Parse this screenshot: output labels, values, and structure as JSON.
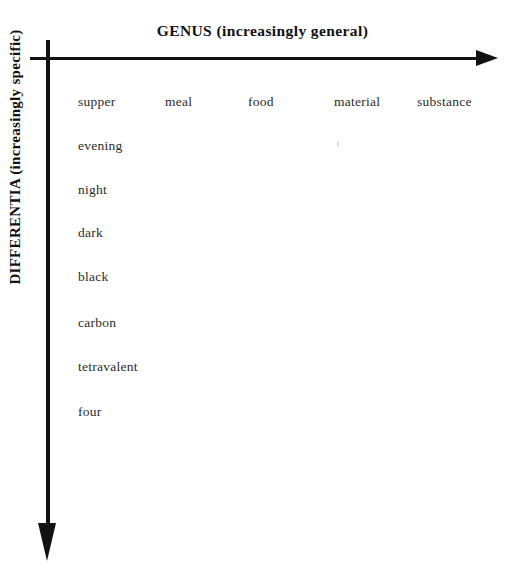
{
  "figure": {
    "background_color": "#ffffff",
    "ink_color": "#121212",
    "text_color": "#2b2b2b"
  },
  "axes": {
    "horizontal": {
      "title": "GENUS  (increasingly general)",
      "direction": "right",
      "arrow": "arrow-right"
    },
    "vertical": {
      "title": "DIFFERENTIA  (increasingly specific)",
      "direction": "down",
      "arrow": "arrow-down"
    }
  },
  "chart_data": {
    "type": "table",
    "title": "GENUS  (increasingly general)",
    "xlabel": "GENUS  (increasingly general)",
    "ylabel": "DIFFERENTIA  (increasingly specific)",
    "genus_row": [
      "supper",
      "meal",
      "food",
      "material",
      "substance"
    ],
    "differentia_column": [
      "supper",
      "evening",
      "night",
      "dark",
      "black",
      "carbon",
      "tetravalent",
      "four"
    ],
    "genus_x_positions": [
      78,
      165,
      248,
      334,
      417
    ],
    "differentia_y_positions": [
      94,
      138,
      182,
      225,
      269,
      315,
      359,
      404
    ],
    "grid": false,
    "legend": "none"
  }
}
